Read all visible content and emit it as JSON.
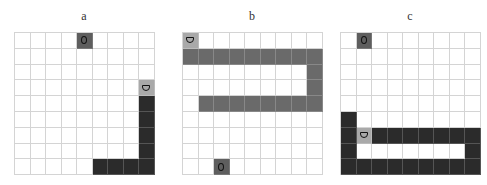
{
  "legend": {
    "food_icon": "circle-O",
    "head_icon": "D-shape"
  },
  "panels": [
    {
      "label": "a",
      "rows": 9,
      "cols": 9,
      "body_style": "dark",
      "food": [
        0,
        4
      ],
      "head": [
        3,
        8
      ],
      "body": [
        [
          4,
          8
        ],
        [
          5,
          8
        ],
        [
          6,
          8
        ],
        [
          7,
          8
        ],
        [
          8,
          8
        ],
        [
          8,
          7
        ],
        [
          8,
          6
        ],
        [
          8,
          5
        ]
      ]
    },
    {
      "label": "b",
      "rows": 9,
      "cols": 9,
      "body_style": "mid",
      "food": [
        8,
        2
      ],
      "head": [
        0,
        0
      ],
      "body": [
        [
          1,
          0
        ],
        [
          1,
          1
        ],
        [
          1,
          2
        ],
        [
          1,
          3
        ],
        [
          1,
          4
        ],
        [
          1,
          5
        ],
        [
          1,
          6
        ],
        [
          1,
          7
        ],
        [
          1,
          8
        ],
        [
          2,
          8
        ],
        [
          3,
          8
        ],
        [
          4,
          8
        ],
        [
          4,
          7
        ],
        [
          4,
          6
        ],
        [
          4,
          5
        ],
        [
          4,
          4
        ],
        [
          4,
          3
        ],
        [
          4,
          2
        ],
        [
          4,
          1
        ]
      ]
    },
    {
      "label": "c",
      "rows": 9,
      "cols": 9,
      "body_style": "dark",
      "food": [
        0,
        1
      ],
      "head": [
        6,
        1
      ],
      "body": [
        [
          6,
          2
        ],
        [
          6,
          3
        ],
        [
          6,
          4
        ],
        [
          6,
          5
        ],
        [
          6,
          6
        ],
        [
          6,
          7
        ],
        [
          6,
          8
        ],
        [
          7,
          8
        ],
        [
          8,
          8
        ],
        [
          8,
          7
        ],
        [
          8,
          6
        ],
        [
          8,
          5
        ],
        [
          8,
          4
        ],
        [
          8,
          3
        ],
        [
          8,
          2
        ],
        [
          8,
          1
        ],
        [
          8,
          0
        ],
        [
          7,
          0
        ],
        [
          6,
          0
        ],
        [
          5,
          0
        ]
      ]
    }
  ]
}
